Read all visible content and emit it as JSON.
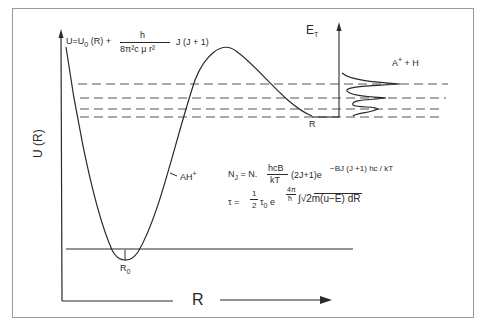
{
  "figure": {
    "axes": {
      "y_label": "U (R)",
      "x_label": "R",
      "inset_y_label": "E",
      "inset_y_label_sub": "T",
      "inset_x_label": "R"
    },
    "labels": {
      "minimum": "R",
      "minimum_sub": "0",
      "molecule": "AH",
      "molecule_sup": "+",
      "products": "A",
      "products_sup": "+",
      "products_rest": " + H"
    },
    "equations": {
      "potential": {
        "lhs": "U=U",
        "lhs_sub": "0",
        "lhs_rest": " (R) +",
        "numerator": "h",
        "denominator": "8π²c μ r²",
        "suffix": "J (J + 1)"
      },
      "population": {
        "lhs": "N",
        "lhs_sub": "J",
        "eq": " = N.",
        "numerator": "hcB",
        "denominator": "kT",
        "middle": "(2J+1)e",
        "exponent": "−BJ (J +1) hc / kT"
      },
      "lifetime": {
        "lhs": "τ = ",
        "frac_num": "1",
        "frac_den": "2",
        "tau0": "τ",
        "tau0_sub": "0",
        "e": "e",
        "exp_num": "4π",
        "exp_den": "ħ",
        "integrand": "∫√2m(u−E)  dR"
      }
    },
    "colors": {
      "line": "#2a2a2a",
      "dash": "#555555",
      "frame": "#999999",
      "background": "#ffffff"
    }
  }
}
